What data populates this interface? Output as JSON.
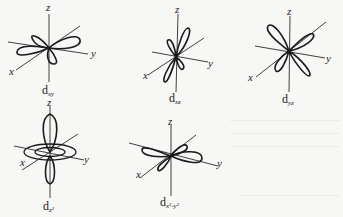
{
  "figure": {
    "colors": {
      "background": "#f7f7f5",
      "line": "#1a1a1a",
      "axis": "#2a2a2a"
    },
    "axis_labels": {
      "x": "x",
      "y": "y",
      "z": "z"
    },
    "orbitals": [
      {
        "id": "dxy",
        "label_main": "d",
        "label_sub": "xy",
        "position": "top-left"
      },
      {
        "id": "dxz",
        "label_main": "d",
        "label_sub": "xz",
        "position": "top-center"
      },
      {
        "id": "dyz",
        "label_main": "d",
        "label_sub": "yz",
        "position": "top-right"
      },
      {
        "id": "dz2",
        "label_main": "d",
        "label_sub": "z²",
        "position": "bottom-left"
      },
      {
        "id": "dx2y2",
        "label_main": "d",
        "label_sub": "x²-y²",
        "position": "bottom-center"
      }
    ]
  }
}
